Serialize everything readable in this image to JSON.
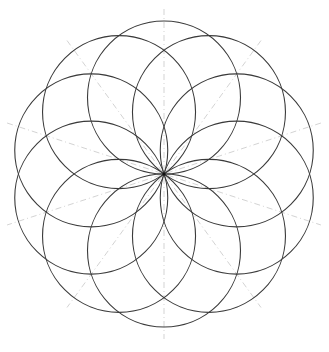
{
  "diagram": {
    "title": "",
    "type": "circle-rosette",
    "center": {
      "x": 164,
      "y": 174
    },
    "circle_count": 10,
    "circle_radius": 76.5,
    "orbit_radius": 76.5,
    "start_angle_deg": 90,
    "circle_stroke": "#3a3a3a",
    "circle_stroke_width": 1.1,
    "guide_lines": {
      "count": 5,
      "angles_deg": [
        18,
        54,
        90,
        126,
        162
      ],
      "length": 165,
      "stroke": "#c8c8c8",
      "dash": "6 3 1 3"
    }
  }
}
